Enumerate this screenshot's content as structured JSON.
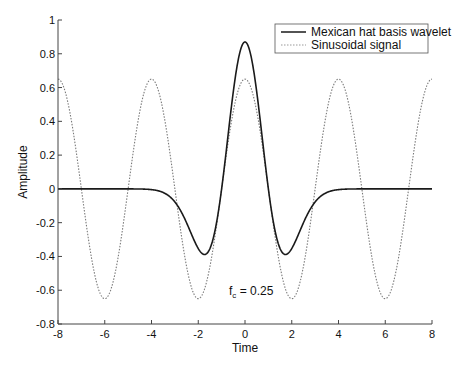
{
  "chart_data": {
    "type": "line",
    "title": "",
    "xlabel": "Time",
    "ylabel": "Amplitude",
    "xlim": [
      -8,
      8
    ],
    "ylim": [
      -0.8,
      1
    ],
    "xticks": [
      -8,
      -6,
      -4,
      -2,
      0,
      2,
      4,
      6,
      8
    ],
    "xtick_labels": [
      "-8",
      "-6",
      "-4",
      "-2",
      "0",
      "2",
      "4",
      "6",
      "8"
    ],
    "yticks": [
      -0.8,
      -0.6,
      -0.4,
      -0.2,
      0,
      0.2,
      0.4,
      0.6,
      0.8,
      1
    ],
    "ytick_labels": [
      "-0.8",
      "-0.6",
      "-0.4",
      "-0.2",
      "0",
      "0.2",
      "0.4",
      "0.6",
      "0.8",
      "1"
    ],
    "grid": false,
    "legend_position": "upper right",
    "annotation": {
      "text_main": "f",
      "text_sub": "c",
      "text_rest": " = 0.25",
      "x": -0.4,
      "y": -0.58
    },
    "series": [
      {
        "name": "Mexican hat basis wavelet",
        "style": "solid",
        "color": "#1a1a1a",
        "formula": "0.87*(1-t^2)*exp(-t^2/2)",
        "params": {
          "amplitude": 0.87,
          "sigma": 1
        },
        "x": [
          -8,
          -6,
          -4,
          -3,
          -2,
          -1.73,
          -1,
          0,
          1,
          1.73,
          2,
          3,
          4,
          6,
          8
        ],
        "values": [
          0,
          0,
          0,
          -0.08,
          -0.35,
          -0.39,
          0,
          0.87,
          0,
          -0.39,
          -0.35,
          -0.08,
          0,
          0,
          0
        ]
      },
      {
        "name": "Sinusoidal signal",
        "style": "dotted",
        "color": "#888888",
        "formula": "0.65*cos(2*pi*0.25*t)",
        "params": {
          "amplitude": 0.65,
          "frequency": 0.25
        },
        "x": [
          -8,
          -7,
          -6,
          -5,
          -4,
          -3,
          -2,
          -1,
          0,
          1,
          2,
          3,
          4,
          5,
          6,
          7,
          8
        ],
        "values": [
          0.65,
          0,
          -0.65,
          0,
          0.65,
          0,
          -0.65,
          0,
          0.65,
          0,
          -0.65,
          0,
          0.65,
          0,
          -0.65,
          0,
          0.65
        ]
      }
    ]
  },
  "legend": {
    "items": [
      {
        "label": "Mexican hat basis wavelet"
      },
      {
        "label": "Sinusoidal signal"
      }
    ]
  },
  "axes": {
    "xlabel": "Time",
    "ylabel": "Amplitude"
  }
}
